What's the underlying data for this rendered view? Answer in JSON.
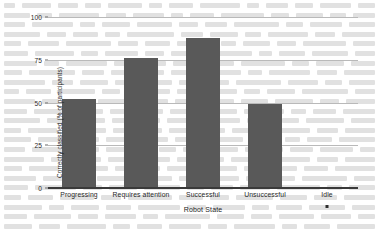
{
  "chart_data": {
    "type": "bar",
    "title": "",
    "xlabel": "Robot State",
    "ylabel": "Correctly classified (% of participants)",
    "categories": [
      "Progressing",
      "Requires attention",
      "Successful",
      "Unsuccessful",
      "Idle"
    ],
    "values": [
      52,
      76,
      88,
      49,
      0
    ],
    "ylim": [
      0,
      100
    ],
    "yticks": [
      0,
      25,
      50,
      75,
      100
    ],
    "ytick_labels": [
      "0",
      "25",
      "50",
      "75",
      "100"
    ],
    "grid": "horizontal",
    "legend": "none",
    "bar_color": "#595959",
    "gridline_color": "#b9b9b9",
    "axis_color": "#3a3a3a"
  },
  "background_text": {
    "note": "faint bleed-through of printed body text from the reverse of the scanned page",
    "line_word_widths": [
      [
        14,
        38,
        26,
        20,
        44,
        18,
        30,
        52,
        16,
        28,
        24,
        40,
        22
      ],
      [
        30,
        18,
        46,
        24,
        36,
        14,
        28,
        50,
        20,
        32,
        18,
        26
      ],
      [
        22,
        44,
        16,
        30,
        38,
        20,
        24,
        48,
        18,
        34,
        28
      ],
      [
        40,
        20,
        28,
        16,
        52,
        24,
        30,
        18,
        44,
        22,
        36
      ],
      [
        18,
        34,
        48,
        22,
        26,
        40,
        16,
        30,
        20,
        46,
        24
      ],
      [
        26,
        42,
        18,
        36,
        20,
        30,
        50,
        14,
        28,
        38,
        22
      ],
      [
        36,
        16,
        44,
        28,
        20,
        34,
        24,
        48,
        18,
        30,
        26
      ],
      [
        20,
        50,
        24,
        32,
        18,
        40,
        28,
        16,
        44,
        22,
        34
      ],
      [
        44,
        22,
        30,
        38,
        16,
        26,
        20,
        48,
        32,
        18,
        28
      ],
      [
        16,
        28,
        40,
        20,
        46,
        24,
        34,
        18,
        30,
        50,
        22
      ],
      [
        32,
        18,
        26,
        44,
        22,
        38,
        16,
        28,
        40,
        20,
        30
      ],
      [
        24,
        46,
        20,
        30,
        18,
        36,
        28,
        42,
        16,
        24,
        34
      ],
      [
        38,
        20,
        34,
        16,
        28,
        48,
        22,
        30,
        18,
        40,
        26
      ],
      [
        18,
        30,
        44,
        24,
        20,
        36,
        16,
        28,
        46,
        22,
        32
      ],
      [
        28,
        40,
        18,
        24,
        34,
        20,
        44,
        30,
        16,
        26,
        38
      ],
      [
        22,
        36,
        26,
        48,
        18,
        30,
        20,
        40,
        24,
        34,
        16
      ],
      [
        42,
        18,
        28,
        20,
        38,
        26,
        16,
        46,
        30,
        22,
        32
      ],
      [
        20,
        32,
        46,
        24,
        18,
        40,
        28,
        34,
        16,
        26,
        44
      ],
      [
        34,
        24,
        18,
        42,
        30,
        20,
        36,
        16,
        28,
        48,
        22
      ],
      [
        26,
        44,
        20,
        30,
        38,
        18,
        24,
        32,
        46,
        16,
        28
      ],
      [
        18,
        28,
        36,
        22,
        48,
        26,
        20,
        40,
        30,
        24,
        34
      ],
      [
        40,
        16,
        30,
        26,
        44,
        20,
        34,
        18,
        28,
        38,
        24
      ],
      [
        24,
        38,
        20,
        32,
        16,
        46,
        28,
        22,
        36,
        30,
        18
      ],
      [
        30,
        22,
        42,
        18,
        26,
        34,
        20,
        44,
        16,
        28,
        40
      ]
    ]
  }
}
